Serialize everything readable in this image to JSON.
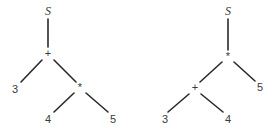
{
  "diagram": {
    "type": "parse-trees",
    "trees": [
      {
        "id": "left",
        "nodes": {
          "root": {
            "label": "S",
            "x": 48,
            "y": 12
          },
          "op1": {
            "label": "+",
            "x": 48,
            "y": 54
          },
          "n3": {
            "label": "3",
            "x": 15,
            "y": 90
          },
          "op2": {
            "label": "*",
            "x": 80,
            "y": 88
          },
          "n4": {
            "label": "4",
            "x": 48,
            "y": 120
          },
          "n5": {
            "label": "5",
            "x": 113,
            "y": 120
          }
        },
        "edges": [
          {
            "x1": 48,
            "y1": 19,
            "x2": 48,
            "y2": 47
          },
          {
            "x1": 42,
            "y1": 60,
            "x2": 21,
            "y2": 82
          },
          {
            "x1": 54,
            "y1": 60,
            "x2": 76,
            "y2": 82
          },
          {
            "x1": 74,
            "y1": 93,
            "x2": 54,
            "y2": 112
          },
          {
            "x1": 86,
            "y1": 93,
            "x2": 108,
            "y2": 112
          }
        ]
      },
      {
        "id": "right",
        "nodes": {
          "root": {
            "label": "S",
            "x": 228,
            "y": 12
          },
          "op1": {
            "label": "*",
            "x": 228,
            "y": 57
          },
          "op2": {
            "label": "+",
            "x": 195,
            "y": 88
          },
          "n5": {
            "label": "5",
            "x": 260,
            "y": 88
          },
          "n3": {
            "label": "3",
            "x": 165,
            "y": 120
          },
          "n4": {
            "label": "4",
            "x": 228,
            "y": 120
          }
        },
        "edges": [
          {
            "x1": 228,
            "y1": 19,
            "x2": 228,
            "y2": 50
          },
          {
            "x1": 222,
            "y1": 62,
            "x2": 200,
            "y2": 82
          },
          {
            "x1": 234,
            "y1": 62,
            "x2": 255,
            "y2": 81
          },
          {
            "x1": 189,
            "y1": 94,
            "x2": 168,
            "y2": 112
          },
          {
            "x1": 201,
            "y1": 94,
            "x2": 223,
            "y2": 112
          }
        ]
      }
    ]
  },
  "colors": {
    "edge": "#2a2a2a",
    "label": "#3a3a3a",
    "background": "#ffffff"
  }
}
